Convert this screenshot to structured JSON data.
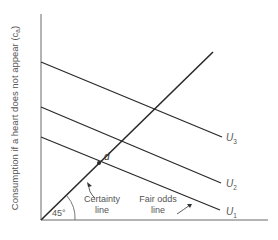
{
  "diagram": {
    "y_axis_label": "Consumption if a heart does not appear (c",
    "y_axis_label_sub": "a",
    "y_axis_label_close": ")",
    "angle_label": "45°",
    "certainty_line_label_1": "Certainty",
    "certainty_line_label_2": "line",
    "fair_odds_label_1": "Fair odds",
    "fair_odds_label_2": "line",
    "point_label": "d",
    "curves": [
      {
        "name": "U",
        "sub": "3"
      },
      {
        "name": "U",
        "sub": "2"
      },
      {
        "name": "U",
        "sub": "1"
      }
    ],
    "colors": {
      "line": "#2a2a2a",
      "axis": "#6a6a6a",
      "text": "#555555"
    }
  }
}
